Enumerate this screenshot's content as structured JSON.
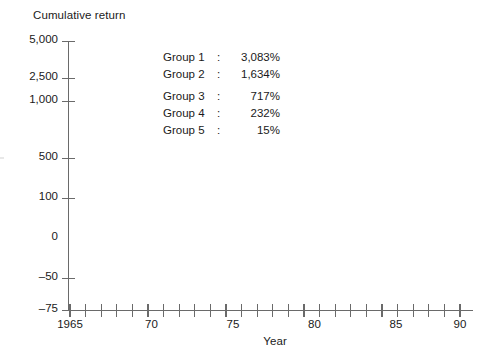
{
  "chart_data": {
    "type": "line",
    "title": "",
    "ylabel": "Cumulative return",
    "xlabel": "Year",
    "grid": false,
    "legend_position": "upper-center",
    "y_axis": {
      "scale": "custom-nonlinear",
      "tick_labels": [
        "5,000",
        "2,500",
        "1,000",
        "500",
        "100",
        "0",
        "–50",
        "–75"
      ],
      "tick_values": [
        5000,
        2500,
        1000,
        500,
        100,
        0,
        -50,
        -75
      ],
      "tick_shown": [
        true,
        true,
        true,
        true,
        true,
        false,
        true,
        true
      ],
      "ylim": [
        -75,
        5000
      ]
    },
    "x_axis": {
      "xlim": [
        1965,
        1990
      ],
      "tick_labels": [
        "1965",
        "70",
        "75",
        "80",
        "85",
        "90"
      ],
      "tick_values": [
        1965,
        1970,
        1975,
        1980,
        1985,
        1990
      ],
      "minor_tick_interval": 1,
      "minor_tick_values": [
        1965,
        1966,
        1967,
        1968,
        1969,
        1970,
        1971,
        1972,
        1973,
        1974,
        1975,
        1976,
        1977,
        1978,
        1979,
        1980,
        1981,
        1982,
        1983,
        1984,
        1985,
        1986,
        1987,
        1988,
        1989,
        1990
      ]
    },
    "series": [
      {
        "name": "Group 1",
        "final_value": 3083,
        "final_label": "3,083%"
      },
      {
        "name": "Group 2",
        "final_value": 1634,
        "final_label": "1,634%"
      },
      {
        "name": "Group 3",
        "final_value": 717,
        "final_label": "717%"
      },
      {
        "name": "Group 4",
        "final_value": 232,
        "final_label": "232%"
      },
      {
        "name": "Group 5",
        "final_value": 15,
        "final_label": "15%"
      }
    ],
    "annotations": [
      "Group 1: 3,083%",
      "Group 2: 1,634%",
      "Group 3:   717%",
      "Group 4:   232%",
      "Group 5:     15%"
    ]
  },
  "axes": {
    "y_title": "Cumulative return",
    "x_title": "Year",
    "y_ticks": [
      {
        "label": "5,000",
        "y": 41,
        "tick": true
      },
      {
        "label": "2,500",
        "y": 78,
        "tick": true
      },
      {
        "label": "1,000",
        "y": 101,
        "tick": true
      },
      {
        "label": "500",
        "y": 158,
        "tick": true
      },
      {
        "label": "100",
        "y": 198,
        "tick": true
      },
      {
        "label": "0",
        "y": 238,
        "tick": false
      },
      {
        "label": "–50",
        "y": 278,
        "tick": true
      },
      {
        "label": "–75",
        "y": 310,
        "tick": true
      }
    ],
    "x_ticks": [
      {
        "label": "1965",
        "x": 70
      },
      {
        "label": "70",
        "x": 151.5
      },
      {
        "label": "75",
        "x": 233
      },
      {
        "label": "80",
        "x": 314.5
      },
      {
        "label": "85",
        "x": 396
      },
      {
        "label": "90",
        "x": 460
      }
    ]
  },
  "legend": {
    "rows": [
      {
        "name": "Group 1",
        "colon": ":",
        "value": "3,083%",
        "gap": false
      },
      {
        "name": "Group 2",
        "colon": ":",
        "value": "1,634%",
        "gap": false
      },
      {
        "name": "Group 3",
        "colon": ":",
        "value": "717%",
        "gap": true
      },
      {
        "name": "Group 4",
        "colon": ":",
        "value": "232%",
        "gap": false
      },
      {
        "name": "Group 5",
        "colon": ":",
        "value": "15%",
        "gap": false
      }
    ]
  },
  "colors": {
    "axis": "#6a6a6a",
    "text": "#1a1a1a",
    "background": "#ffffff"
  }
}
